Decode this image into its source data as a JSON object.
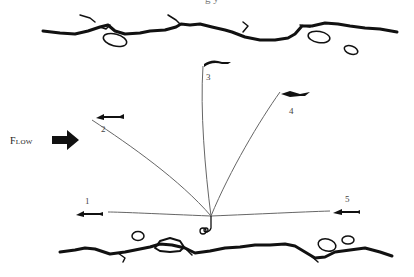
{
  "figure": {
    "caption_fragment": "g y",
    "flow_label": "Flow",
    "positions": [
      {
        "id": "1",
        "label": "1",
        "x": 87,
        "y": 203
      },
      {
        "id": "2",
        "label": "2",
        "x": 103,
        "y": 131
      },
      {
        "id": "3",
        "label": "3",
        "x": 208,
        "y": 79
      },
      {
        "id": "4",
        "label": "4",
        "x": 291,
        "y": 113
      },
      {
        "id": "5",
        "label": "5",
        "x": 347,
        "y": 201
      }
    ],
    "colors": {
      "ink": "#111111",
      "line": "#666666",
      "background": "#ffffff"
    }
  }
}
